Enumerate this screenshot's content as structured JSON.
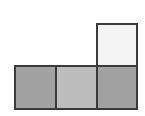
{
  "diagram": {
    "squares": [
      {
        "id": "top-right",
        "row": 0,
        "col": 2,
        "fill": "#f4f4f4",
        "left": 96,
        "top": 23,
        "width": 42,
        "height": 44
      },
      {
        "id": "bottom-left",
        "row": 1,
        "col": 0,
        "fill": "#a2a2a2",
        "left": 14,
        "top": 65,
        "width": 43,
        "height": 45
      },
      {
        "id": "bottom-middle",
        "row": 1,
        "col": 1,
        "fill": "#bcbcbc",
        "left": 55,
        "top": 65,
        "width": 43,
        "height": 45
      },
      {
        "id": "bottom-right",
        "row": 1,
        "col": 2,
        "fill": "#a2a2a2",
        "left": 96,
        "top": 65,
        "width": 42,
        "height": 45
      }
    ],
    "border_color": "#3a3a3a"
  }
}
